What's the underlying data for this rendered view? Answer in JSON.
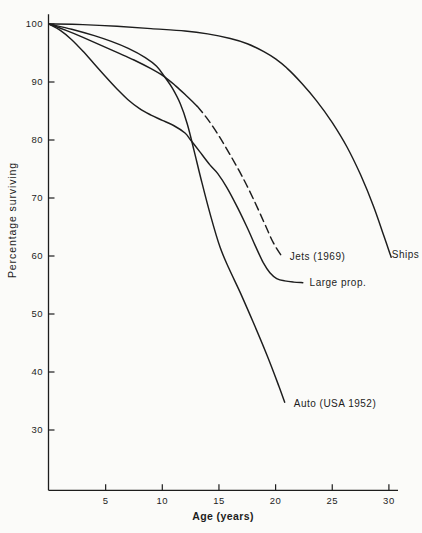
{
  "figure": {
    "ink_color": "#1d1d1d",
    "paper_color": "#fbfbf9"
  },
  "chart_data": {
    "type": "line",
    "title": "",
    "xlabel": "Age (years)",
    "ylabel": "Percentage surviving",
    "xlim": [
      0,
      31
    ],
    "ylim": [
      19.6,
      101.7
    ],
    "x_ticks": [
      5,
      10,
      15,
      20,
      25,
      30
    ],
    "y_ticks": [
      100,
      90,
      80,
      70,
      60,
      50,
      40,
      30
    ],
    "grid": false,
    "legend": "inline-labels",
    "series": [
      {
        "name": "ships",
        "label": "Ships",
        "dash": false,
        "label_at": [
          30.25,
          60.2
        ],
        "points": [
          [
            0,
            100
          ],
          [
            3,
            99.9
          ],
          [
            6,
            99.6
          ],
          [
            9,
            99.2
          ],
          [
            12,
            98.8
          ],
          [
            14,
            98.3
          ],
          [
            16,
            97.5
          ],
          [
            17.5,
            96.6
          ],
          [
            19,
            95.2
          ],
          [
            20,
            94.0
          ],
          [
            21,
            92.4
          ],
          [
            22.3,
            89.8
          ],
          [
            23.6,
            86.8
          ],
          [
            25,
            83.0
          ],
          [
            26.3,
            78.8
          ],
          [
            27.5,
            74.0
          ],
          [
            28.6,
            68.8
          ],
          [
            29.5,
            63.8
          ],
          [
            30.2,
            59.8
          ]
        ]
      },
      {
        "name": "jets-observed",
        "label": "",
        "dash": false,
        "label_at": null,
        "points": [
          [
            0,
            100
          ],
          [
            1.5,
            98.9
          ],
          [
            3,
            97.7
          ],
          [
            4.5,
            96.4
          ],
          [
            6,
            95.1
          ],
          [
            7.5,
            93.8
          ],
          [
            9,
            92.3
          ],
          [
            10.2,
            90.9
          ],
          [
            11.2,
            89.3
          ],
          [
            12.2,
            87.5
          ],
          [
            13.1,
            85.8
          ]
        ]
      },
      {
        "name": "jets-projected",
        "label": "Jets (1969)",
        "dash": true,
        "label_at": [
          21.25,
          59.9
        ],
        "points": [
          [
            13.1,
            85.8
          ],
          [
            14,
            83.6
          ],
          [
            15,
            80.7
          ],
          [
            16,
            77.4
          ],
          [
            17,
            73.9
          ],
          [
            18,
            70.0
          ],
          [
            19,
            65.7
          ],
          [
            19.8,
            62.3
          ],
          [
            20.65,
            59.6
          ]
        ]
      },
      {
        "name": "large-prop",
        "label": "Large prop.",
        "dash": false,
        "label_at": [
          23.0,
          55.3
        ],
        "points": [
          [
            0,
            100
          ],
          [
            1,
            98.9
          ],
          [
            2,
            97.3
          ],
          [
            3,
            95.3
          ],
          [
            4,
            93.1
          ],
          [
            5,
            90.9
          ],
          [
            6,
            88.8
          ],
          [
            7,
            86.9
          ],
          [
            8,
            85.4
          ],
          [
            9,
            84.3
          ],
          [
            10,
            83.4
          ],
          [
            11,
            82.5
          ],
          [
            12,
            81.2
          ],
          [
            12.5,
            80.0
          ],
          [
            13.3,
            78.0
          ],
          [
            14.2,
            75.7
          ],
          [
            14.9,
            74.2
          ],
          [
            15.7,
            71.8
          ],
          [
            16.5,
            68.9
          ],
          [
            17.4,
            65.3
          ],
          [
            18.2,
            61.8
          ],
          [
            18.9,
            58.9
          ],
          [
            19.5,
            57.1
          ],
          [
            20.1,
            56.1
          ],
          [
            20.8,
            55.7
          ],
          [
            21.6,
            55.5
          ],
          [
            22.4,
            55.4
          ]
        ]
      },
      {
        "name": "auto",
        "label": "Auto (USA 1952)",
        "dash": false,
        "label_at": [
          21.6,
          34.6
        ],
        "points": [
          [
            0,
            100
          ],
          [
            2,
            99.1
          ],
          [
            4,
            98.0
          ],
          [
            5.5,
            97.0
          ],
          [
            7,
            95.8
          ],
          [
            8.5,
            94.2
          ],
          [
            9.5,
            92.7
          ],
          [
            10.2,
            90.9
          ],
          [
            10.9,
            88.9
          ],
          [
            11.6,
            86.2
          ],
          [
            12.2,
            82.8
          ],
          [
            12.8,
            78.2
          ],
          [
            13.5,
            72.6
          ],
          [
            14.3,
            66.7
          ],
          [
            15.1,
            61.5
          ],
          [
            15.9,
            57.8
          ],
          [
            16.9,
            53.6
          ],
          [
            18,
            48.7
          ],
          [
            19.2,
            43.1
          ],
          [
            20.3,
            37.5
          ],
          [
            20.8,
            34.8
          ]
        ]
      }
    ]
  }
}
